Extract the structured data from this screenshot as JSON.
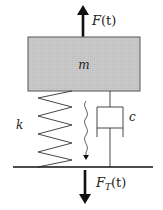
{
  "diagram": {
    "mass_label": "m",
    "spring_label": "k",
    "damper_label": "c",
    "applied_force": {
      "symbol": "F",
      "arg": "(t)"
    },
    "transmitted_force": {
      "symbol": "F",
      "subscript": "T",
      "arg": "(t)"
    },
    "colors": {
      "mass_fill": "#c8c8c8",
      "mass_stroke": "#6e6e6e",
      "line": "#333333",
      "arrow": "#111111"
    }
  }
}
